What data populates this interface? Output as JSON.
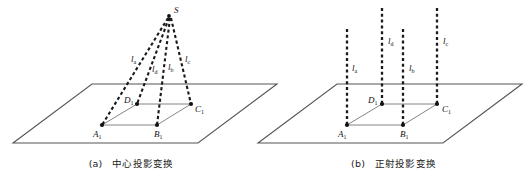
{
  "figure": {
    "kind": "geometry-diagram",
    "panels": [
      {
        "id": "a",
        "caption_index": "(a)",
        "caption_text": "中心投影变换",
        "projection_type": "central",
        "apex": {
          "label": "S",
          "subscript": "",
          "x": 168,
          "y": 16
        },
        "vertices": [
          {
            "label": "A",
            "subscript": "1",
            "x": 102,
            "y": 125,
            "label_dx": -9,
            "label_dy": 12
          },
          {
            "label": "B",
            "subscript": "1",
            "x": 157,
            "y": 125,
            "label_dx": -3,
            "label_dy": 12
          },
          {
            "label": "C",
            "subscript": "1",
            "x": 191,
            "y": 104,
            "label_dx": 4,
            "label_dy": 8
          },
          {
            "label": "D",
            "subscript": "1",
            "x": 137,
            "y": 104,
            "label_dx": -13,
            "label_dy": -1
          }
        ],
        "rays": [
          {
            "label": "l",
            "subscript": "a",
            "from": "S",
            "to": "A",
            "label_x": 131,
            "label_y": 62
          },
          {
            "label": "l",
            "subscript": "d",
            "from": "S",
            "to": "D",
            "label_x": 152,
            "label_y": 72
          },
          {
            "label": "l",
            "subscript": "b",
            "from": "S",
            "to": "B",
            "label_x": 168,
            "label_y": 70
          },
          {
            "label": "l",
            "subscript": "c",
            "from": "S",
            "to": "C",
            "label_x": 185,
            "label_y": 62
          }
        ],
        "ground_plane": "parallelogram"
      },
      {
        "id": "b",
        "caption_index": "(b)",
        "caption_text": "正射投影变换",
        "projection_type": "orthographic",
        "apex": null,
        "vertices": [
          {
            "label": "A",
            "subscript": "1",
            "x": 347,
            "y": 125,
            "label_dx": -9,
            "label_dy": 12
          },
          {
            "label": "B",
            "subscript": "1",
            "x": 403,
            "y": 125,
            "label_dx": -3,
            "label_dy": 12
          },
          {
            "label": "C",
            "subscript": "1",
            "x": 437,
            "y": 104,
            "label_dx": 5,
            "label_dy": 8
          },
          {
            "label": "D",
            "subscript": "1",
            "x": 382,
            "y": 104,
            "label_dx": -14,
            "label_dy": -1
          }
        ],
        "rays": [
          {
            "label": "l",
            "subscript": "a",
            "x": 347,
            "top": 29,
            "label_x": 352,
            "label_y": 71
          },
          {
            "label": "l",
            "subscript": "d",
            "x": 382,
            "top": 8,
            "label_x": 388,
            "label_y": 44
          },
          {
            "label": "l",
            "subscript": "b",
            "x": 403,
            "top": 29,
            "label_x": 409,
            "label_y": 71
          },
          {
            "label": "l",
            "subscript": "c",
            "x": 437,
            "top": 8,
            "label_x": 443,
            "label_y": 44
          }
        ],
        "ground_plane": "parallelogram"
      }
    ],
    "colors": {
      "stroke_dark": "#1a1a1a",
      "plane_edge": "#555555",
      "quad_edge": "#777777",
      "background": "#ffffff"
    }
  }
}
